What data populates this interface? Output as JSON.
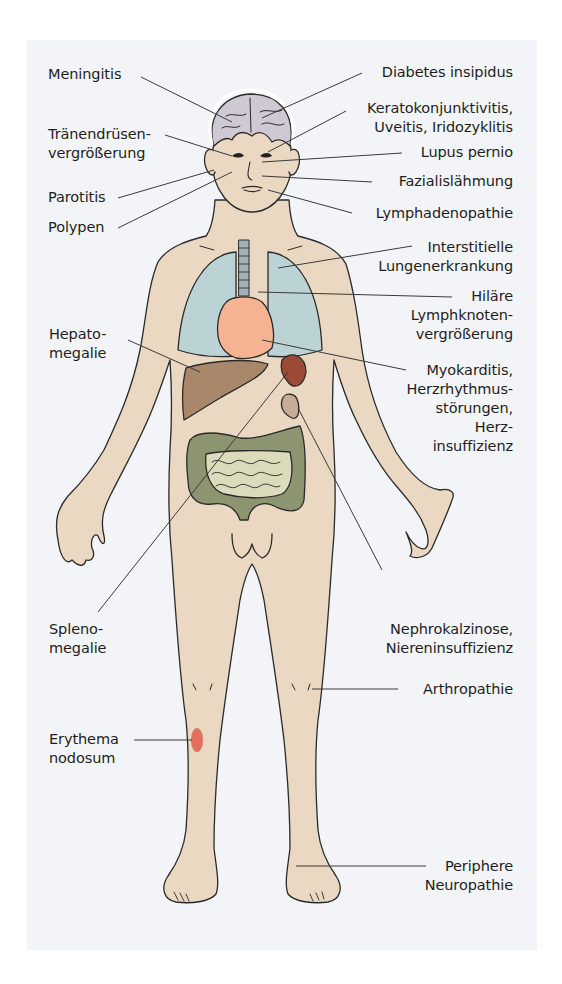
{
  "figure": {
    "type": "anatomical-diagram",
    "colors": {
      "background_panel": "#f3f4f7",
      "skin": "#ead8c2",
      "brain": "#cfc9d3",
      "lungs": "#bcd3d6",
      "heart": "#f6b394",
      "liver": "#a8876a",
      "spleen": "#9a4a36",
      "colon": "#8c9470",
      "small_intestine": "#dcdcbc",
      "kidney": "#c7ac96",
      "erythema": "#e2705f",
      "outline": "#2a2a2a",
      "leader_line": "#3a3a3a"
    }
  },
  "labels_left": [
    {
      "id": "meningitis",
      "text": "Meningitis"
    },
    {
      "id": "traenendruesen",
      "text": "Tränendrüsen-\nvergrößerung"
    },
    {
      "id": "parotitis",
      "text": "Parotitis"
    },
    {
      "id": "polypen",
      "text": "Polypen"
    },
    {
      "id": "hepatomegalie",
      "text": "Hepato-\nmegalie"
    },
    {
      "id": "splenomegalie",
      "text": "Spleno-\nmegalie"
    },
    {
      "id": "erythema",
      "text": "Erythema\nnodosum"
    }
  ],
  "labels_right": [
    {
      "id": "diabetes",
      "text": "Diabetes insipidus"
    },
    {
      "id": "kerato",
      "text": "Keratokonjunktivitis,\nUveitis, Iridozyklitis"
    },
    {
      "id": "lupus",
      "text": "Lupus pernio"
    },
    {
      "id": "fazialis",
      "text": "Fazialislähmung"
    },
    {
      "id": "lymphadeno",
      "text": "Lymphadenopathie"
    },
    {
      "id": "interstitielle",
      "text": "Interstitielle\nLungenerkrankung"
    },
    {
      "id": "hilaere",
      "text": "Hiläre\nLymphknoten-\nvergrößerung"
    },
    {
      "id": "myokarditis",
      "text": "Myokarditis,\nHerzrhythmus-\nstörungen,\nHerz-\ninsuffizienz"
    },
    {
      "id": "nephro",
      "text": "Nephrokalzinose,\nNiereninsuffizienz"
    },
    {
      "id": "arthropathie",
      "text": "Arthropathie"
    },
    {
      "id": "neuropathie",
      "text": "Periphere\nNeuropathie"
    }
  ]
}
